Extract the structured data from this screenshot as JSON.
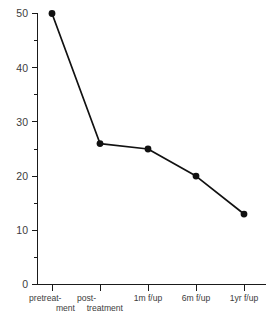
{
  "chart_data": {
    "type": "line",
    "title": "",
    "subtitle": "",
    "xlabel": "",
    "ylabel": "",
    "categories": [
      "pretreatment",
      "post-treatment",
      "1m f/up",
      "6m f/up",
      "1yr f/up"
    ],
    "values": [
      50,
      26,
      25,
      20,
      13
    ],
    "series": [
      {
        "name": "",
        "values": [
          50,
          26,
          25,
          20,
          13
        ]
      }
    ],
    "ylim": [
      0,
      50
    ],
    "xlim": [
      0,
      4
    ],
    "y_major_ticks": [
      0,
      10,
      20,
      30,
      40,
      50
    ],
    "y_minor_ticks": [
      5,
      15,
      25,
      35,
      45
    ],
    "y_tick_labels": [
      "0",
      "10",
      "20",
      "30",
      "40",
      "50"
    ],
    "grid": false,
    "legend": false,
    "legend_position": "none",
    "marker": "filled-circle",
    "line_color": "#111111",
    "marker_color": "#111111",
    "axis_color": "#1a1a1a",
    "label_color": "#3c3c3c",
    "background_color": "#ffffff"
  },
  "axes": {
    "y_ticks": [
      {
        "value": 50,
        "label": "50"
      },
      {
        "value": 40,
        "label": "40"
      },
      {
        "value": 30,
        "label": "30"
      },
      {
        "value": 20,
        "label": "20"
      },
      {
        "value": 10,
        "label": "10"
      },
      {
        "value": 0,
        "label": "0"
      }
    ],
    "x_ticks": [
      {
        "index": 0,
        "line1": "pretreat-",
        "line2": "ment",
        "align": "wrapped"
      },
      {
        "index": 1,
        "line1": "post-",
        "line2": "treatment",
        "align": "wrapped"
      },
      {
        "index": 2,
        "line1": "1m f/up",
        "line2": "",
        "align": "single"
      },
      {
        "index": 3,
        "line1": "6m f/up",
        "line2": "",
        "align": "single"
      },
      {
        "index": 4,
        "line1": "1yr f/up",
        "line2": "",
        "align": "single"
      }
    ]
  },
  "points": [
    {
      "category": "pretreatment",
      "value": 50,
      "label": "50"
    },
    {
      "category": "post-treatment",
      "value": 26,
      "label": "26"
    },
    {
      "category": "1m f/up",
      "value": 25,
      "label": "25"
    },
    {
      "category": "6m f/up",
      "value": 20,
      "label": "20"
    },
    {
      "category": "1yr f/up",
      "value": 13,
      "label": "13"
    }
  ]
}
